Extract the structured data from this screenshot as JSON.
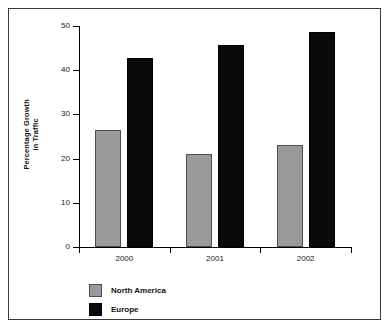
{
  "chart_data": {
    "type": "bar",
    "title": "",
    "xlabel": "",
    "ylabel_lines": [
      "Percentage Growth",
      "in Traffic"
    ],
    "categories": [
      "2000",
      "2001",
      "2002"
    ],
    "series": [
      {
        "name": "North America",
        "color": "#9a9a9a",
        "values": [
          26.5,
          21.0,
          23.0
        ]
      },
      {
        "name": "Europe",
        "color": "#0a0a0a",
        "values": [
          42.8,
          45.7,
          48.6
        ]
      }
    ],
    "ylim": [
      0,
      50
    ],
    "yticks": [
      0,
      10,
      20,
      30,
      40,
      50
    ],
    "ytick_labels": [
      "0",
      "10",
      "20",
      "30",
      "40",
      "50"
    ],
    "grid": false,
    "legend_position": "bottom-left",
    "legend": [
      {
        "label": "North America",
        "swatch": "gray-square-swatch"
      },
      {
        "label": "Europe",
        "swatch": "black-square-swatch"
      }
    ]
  }
}
